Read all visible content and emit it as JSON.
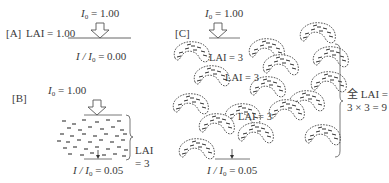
{
  "panel_a": {
    "label": "[A]",
    "lai_text": "LAI = 1.00",
    "i0_var": "I",
    "i0_sub": "0",
    "i0_value": "= 1.00",
    "ratio_var": "I / I",
    "ratio_sub": "0",
    "ratio_value": "= 0.00"
  },
  "panel_b": {
    "label": "[B]",
    "i0_var": "I",
    "i0_sub": "0",
    "i0_value": "= 1.00",
    "lai_label": "LAI",
    "lai_value": "= 3",
    "ratio_var": "I / I",
    "ratio_sub": "0",
    "ratio_value": "= 0.05"
  },
  "panel_c": {
    "label": "[C]",
    "i0_var": "I",
    "i0_sub": "0",
    "i0_value": "= 1.00",
    "layer_labels": [
      "LAI = 3",
      "LAI = 3",
      "LAI = 3"
    ],
    "total_line1": "全 LAI =",
    "total_line2": "3 × 3 = 9",
    "ratio_var": "I / I",
    "ratio_sub": "0",
    "ratio_value": "= 0.05"
  }
}
